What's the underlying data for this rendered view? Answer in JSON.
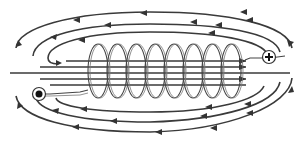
{
  "diagram": {
    "title": "Magnetic field lines around a solenoid",
    "coil_turns": 8,
    "terminals": [
      {
        "id": "positive",
        "symbol": "+",
        "position": "right"
      },
      {
        "id": "negative",
        "symbol": "•",
        "position": "left"
      }
    ],
    "field_line_direction_outside": "right-to-left",
    "field_line_direction_inside": "left-to-right",
    "colors": {
      "line": "#3a3a3a",
      "background": "#ffffff"
    }
  }
}
